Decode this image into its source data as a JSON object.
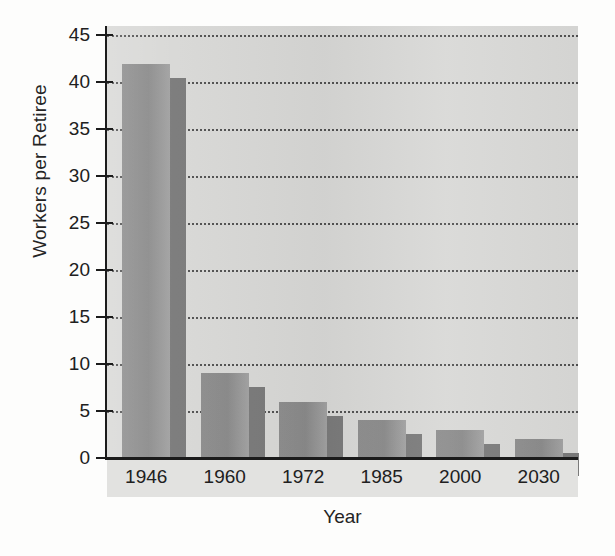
{
  "chart_data": {
    "type": "bar",
    "title": "",
    "xlabel": "Year",
    "ylabel": "Workers per Retiree",
    "categories": [
      "1946",
      "1960",
      "1972",
      "1985",
      "2000",
      "2030"
    ],
    "values": [
      42,
      9,
      6,
      4,
      3,
      2
    ],
    "ylim": [
      0,
      46
    ],
    "yticks": [
      0,
      5,
      10,
      15,
      20,
      25,
      30,
      35,
      40,
      45
    ],
    "ytick_labels": [
      "0",
      "5",
      "10",
      "15",
      "20",
      "25",
      "30",
      "35",
      "40",
      "45"
    ],
    "grid": true,
    "grid_style": "dotted-horizontal",
    "legend": "none",
    "series": [
      {
        "name": "Workers per Retiree",
        "values": [
          42,
          9,
          6,
          4,
          3,
          2
        ]
      }
    ],
    "colors": {
      "bar_fill": "#8d8d8d",
      "bar_highlight": "#a2a2a2",
      "bar_shadow": "#7a7a7a",
      "plot_background": "#d8d8d6",
      "axis": "#1b1b1b",
      "gridline": "#3a3a3a",
      "text": "#202020",
      "page_background": "#fdfdfc"
    }
  }
}
